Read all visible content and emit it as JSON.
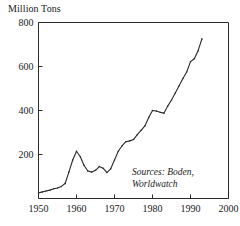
{
  "chart_data": {
    "type": "line",
    "title": "Million Tons",
    "xlabel": "",
    "ylabel": "Million Tons",
    "xlim": [
      1950,
      2000
    ],
    "ylim": [
      0,
      800
    ],
    "grid": false,
    "legend": null,
    "xticks": [
      1950,
      1960,
      1970,
      1980,
      1990,
      2000
    ],
    "xtick_labels": [
      "1950",
      "1960",
      "1970",
      "1980",
      "1990",
      "2000"
    ],
    "yticks": [
      200,
      400,
      600,
      800
    ],
    "ytick_labels": [
      "200",
      "400",
      "600",
      "800"
    ],
    "annotation": "Sources: Boden,\nWorldwatch",
    "markers": "small-dots",
    "series": [
      {
        "name": "Million Tons",
        "x": [
          1950,
          1951,
          1952,
          1953,
          1954,
          1955,
          1956,
          1957,
          1958,
          1959,
          1960,
          1961,
          1962,
          1963,
          1964,
          1965,
          1966,
          1967,
          1968,
          1969,
          1970,
          1971,
          1972,
          1973,
          1974,
          1975,
          1976,
          1977,
          1978,
          1979,
          1980,
          1981,
          1982,
          1983,
          1984,
          1985,
          1986,
          1987,
          1988,
          1989,
          1990,
          1991,
          1992,
          1993
        ],
        "values": [
          25,
          30,
          34,
          38,
          44,
          48,
          55,
          68,
          120,
          175,
          215,
          190,
          150,
          125,
          120,
          128,
          145,
          138,
          118,
          135,
          175,
          215,
          240,
          258,
          262,
          268,
          290,
          310,
          330,
          368,
          400,
          398,
          392,
          388,
          420,
          448,
          480,
          512,
          545,
          575,
          622,
          635,
          672,
          725
        ]
      }
    ]
  }
}
